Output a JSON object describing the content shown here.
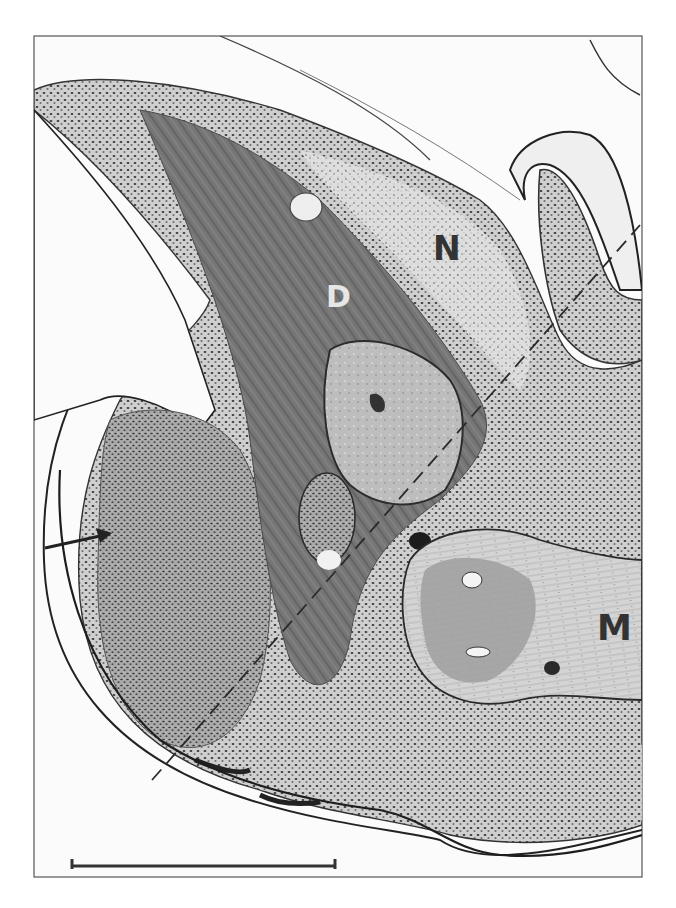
{
  "figure": {
    "type": "grayscale histological micrograph",
    "labels": {
      "N": "N",
      "D": "D",
      "M": "M"
    },
    "annotations": {
      "arrow": "arrow-pointing-right",
      "dashed_line": "dashed-section-line",
      "scale_bar": "scale-bar"
    },
    "colors": {
      "background": "#ffffff",
      "frame": "#555555",
      "dense_tissue": "#6e6e6e",
      "light_tissue": "#c8c8c8",
      "pale_tissue": "#e2e2e2",
      "outline": "#222222",
      "label_dark": "#333333",
      "label_light": "#e6e6e6"
    }
  }
}
